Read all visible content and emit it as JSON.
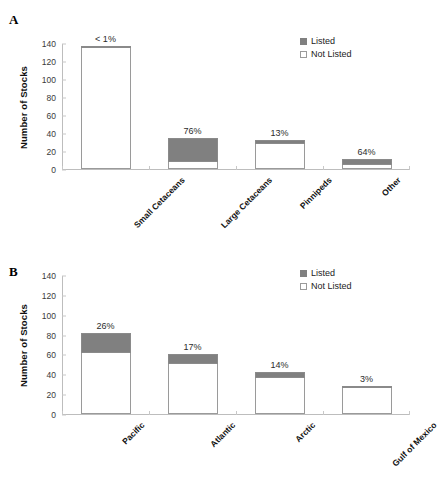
{
  "figure": {
    "panels": [
      {
        "id": "A",
        "label": "A",
        "ylabel": "Number of Stocks",
        "legend": {
          "listed": "Listed",
          "not_listed": "Not Listed"
        }
      },
      {
        "id": "B",
        "label": "B",
        "ylabel": "Number of Stocks",
        "legend": {
          "listed": "Listed",
          "not_listed": "Not Listed"
        }
      }
    ]
  },
  "chart_data": [
    {
      "type": "bar",
      "id": "panel-a",
      "title": "A",
      "stacked": true,
      "xlabel": "",
      "ylabel": "Number of Stocks",
      "ylim": [
        0,
        140
      ],
      "yticks": [
        0,
        20,
        40,
        60,
        80,
        100,
        120,
        140
      ],
      "ytick_labels": [
        "0",
        "20",
        "40",
        "60",
        "80",
        "100",
        "120",
        "140"
      ],
      "grid": false,
      "legend_position": "top-right",
      "categories": [
        "Small Cetaceans",
        "Large Cetaceans",
        "Pinnipeds",
        "Other"
      ],
      "series": [
        {
          "name": "Not Listed",
          "color": "#ffffff",
          "values": [
            136,
            8,
            28,
            4
          ]
        },
        {
          "name": "Listed",
          "color": "#808080",
          "values": [
            1,
            26,
            4,
            7
          ]
        }
      ],
      "totals": [
        137,
        34,
        32,
        11
      ],
      "data_labels": [
        "< 1%",
        "76%",
        "13%",
        "64%"
      ]
    },
    {
      "type": "bar",
      "id": "panel-b",
      "title": "B",
      "stacked": true,
      "xlabel": "",
      "ylabel": "Number of Stocks",
      "ylim": [
        0,
        140
      ],
      "yticks": [
        0,
        20,
        40,
        60,
        80,
        100,
        120,
        140
      ],
      "ytick_labels": [
        "0",
        "20",
        "40",
        "60",
        "80",
        "100",
        "120",
        "140"
      ],
      "grid": false,
      "legend_position": "top-right",
      "categories": [
        "Pacific",
        "Atlantic",
        "Arctic",
        "Gulf of Mexico"
      ],
      "series": [
        {
          "name": "Not Listed",
          "color": "#ffffff",
          "values": [
            61,
            50,
            36,
            27
          ]
        },
        {
          "name": "Listed",
          "color": "#808080",
          "values": [
            21,
            10,
            6,
            1
          ]
        }
      ],
      "totals": [
        82,
        60,
        42,
        28
      ],
      "data_labels": [
        "26%",
        "17%",
        "14%",
        "3%"
      ]
    }
  ]
}
